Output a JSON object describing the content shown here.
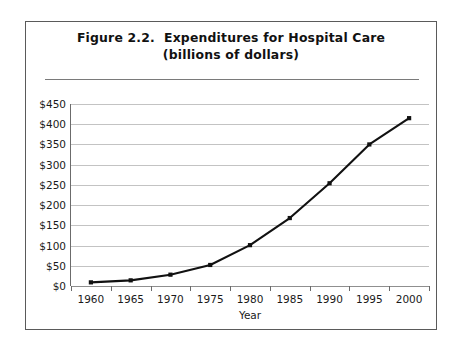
{
  "figure": {
    "title_line1": "Figure 2.2.  Expenditures for Hospital Care",
    "title_line2": "(billions of dollars)"
  },
  "chart_data": {
    "type": "line",
    "title": "Figure 2.2.  Expenditures for Hospital Care (billions of dollars)",
    "xlabel": "Year",
    "ylabel": "",
    "categories": [
      "1960",
      "1965",
      "1970",
      "1975",
      "1980",
      "1985",
      "1990",
      "1995",
      "2000"
    ],
    "values": [
      9,
      14,
      28,
      52,
      101,
      168,
      254,
      350,
      415
    ],
    "x_tick_labels": [
      "1960",
      "1965",
      "1970",
      "1975",
      "1980",
      "1985",
      "1990",
      "1995",
      "2000"
    ],
    "y_tick_labels": [
      "$0",
      "$50",
      "$100",
      "$150",
      "$200",
      "$250",
      "$300",
      "$350",
      "$400",
      "$450"
    ],
    "y_tick_values": [
      0,
      50,
      100,
      150,
      200,
      250,
      300,
      350,
      400,
      450
    ],
    "ylim": [
      0,
      450
    ],
    "grid": "horizontal",
    "legend": "none",
    "series_color": "#111111",
    "gridline_color": "#c3c3c3",
    "marker": "square"
  }
}
